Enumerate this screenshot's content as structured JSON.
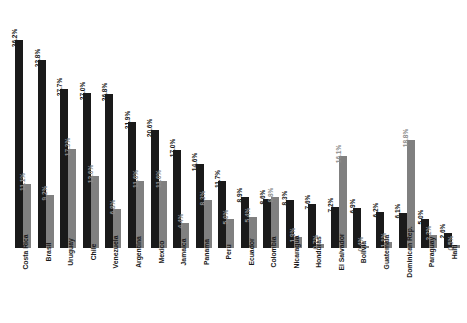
{
  "chart_data": {
    "type": "bar",
    "title": "",
    "subtitle": "",
    "xlabel": "",
    "ylabel": "",
    "ylim": [
      0,
      36.2
    ],
    "grid": false,
    "legend_position": "none",
    "value_suffix": "%",
    "colors": {
      "series_dark": "#1a1a1a",
      "series_light": "#808080",
      "background": "#ffffff",
      "label_dark": "#1a1a1a",
      "label_light": "#8c8c8c"
    },
    "categories": [
      "Costa Rica",
      "Brasil",
      "Uruguay",
      "Chile",
      "Venezuela",
      "Argentina",
      "Mexico",
      "Jamaica",
      "Panama",
      "Peru",
      "Ecuador",
      "Colombia",
      "Nicaragua",
      "Honduras",
      "El Salvador",
      "Bolivia",
      "Guatemala",
      "Dominican Rep.",
      "Paraguay",
      "Haiti"
    ],
    "series": [
      {
        "name": "series-dark",
        "values": [
          36.2,
          32.8,
          27.7,
          27.0,
          26.8,
          21.9,
          20.6,
          17.0,
          14.6,
          11.7,
          8.9,
          8.6,
          8.3,
          7.6,
          7.2,
          6.9,
          6.2,
          6.1,
          5.0,
          2.6
        ],
        "labels": [
          "36.2%",
          "32.8%",
          "27.7%",
          "27.0%",
          "26.8%",
          "21.9%",
          "20.6%",
          "17.0%",
          "14.6%",
          "11.7%",
          "8.9%",
          "8.6%",
          "8.3%",
          "7.6%",
          "7.2%",
          "6.9%",
          "6.2%",
          "6.1%",
          "5.0%",
          "2.6%"
        ]
      },
      {
        "name": "series-light",
        "values": [
          11.1,
          9.2,
          17.3,
          12.6,
          6.8,
          11.6,
          11.6,
          4.4,
          8.3,
          5.0,
          5.4,
          8.8,
          1.9,
          0.7,
          16.1,
          0.4,
          1.1,
          18.8,
          2.2,
          0.5
        ],
        "labels": [
          "11.1%",
          "9.2%",
          "17.3%",
          "12.6%",
          "6.8%",
          "11.6%",
          "11.6%",
          "4.4%",
          "8.3%",
          "5.0%",
          "5.4%",
          "8.8%",
          "1.9%",
          "0.7%",
          "16.1%",
          "0.4%",
          "1.1%",
          "18.8%",
          "2.2%",
          "0.5%"
        ]
      }
    ]
  }
}
